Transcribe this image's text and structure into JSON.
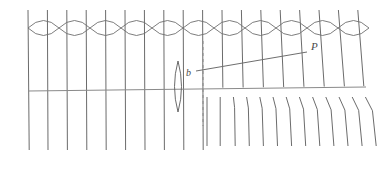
{
  "figure": {
    "width": 380,
    "height": 170,
    "background_color": "#ffffff",
    "stroke_color": "#6e6e6e",
    "stroke_color_dark": "#5a5a5a",
    "label_color": "#4a4a4a",
    "stroke_width": 0.9
  },
  "labels": {
    "point_p": "P",
    "impact_parameter_b": "b"
  },
  "axis": {
    "name": "optical-axis",
    "x1": 28,
    "y1": 91,
    "x2": 366,
    "y2": 87,
    "color": "#8a8a8a"
  },
  "dashed_line": {
    "name": "vertical-dashed-reference-line",
    "x": 203,
    "y_top": 41,
    "y_bottom": 126,
    "dash": "3,3",
    "color": "#8a8a8a"
  },
  "diagonal_ray": {
    "name": "ray-to-P",
    "x1": 196,
    "y1": 71,
    "x2": 307,
    "y2": 52,
    "color": "#6e6e6e"
  },
  "lens_caustic": {
    "name": "vertical-lens-caustic",
    "center_x": 178,
    "center_y": 87,
    "top_y": 61,
    "bottom_y": 112,
    "half_width": 7
  },
  "wavefront_chain": {
    "name": "horizontal-lens-chain",
    "count": 11,
    "start_x": 28,
    "cell_width": 31,
    "center_y": 28,
    "half_height": 7.5,
    "comment": "chain of horizontal vesica/lens shapes meeting at cusp crossing points"
  },
  "upper_rays": {
    "name": "upper-vertical-rays",
    "count": 18,
    "start_x": 28,
    "spacing": 19.4,
    "y_top": 10,
    "y_bottom_left": 150,
    "comment": "near-vertical field lines; left of dashed line they run full height, right of it they stop at axis"
  },
  "lower_right_rays": {
    "name": "lower-right-bent-rays",
    "count": 13,
    "start_x": 207,
    "spacing": 13.2,
    "y_top": 97,
    "y_bottom": 146,
    "comment": "segments below axis on the right, increasingly kinked/slanted away from the dashed line"
  },
  "label_positions": {
    "p_x": 311,
    "p_y": 50,
    "b_x": 186,
    "b_y": 76
  }
}
